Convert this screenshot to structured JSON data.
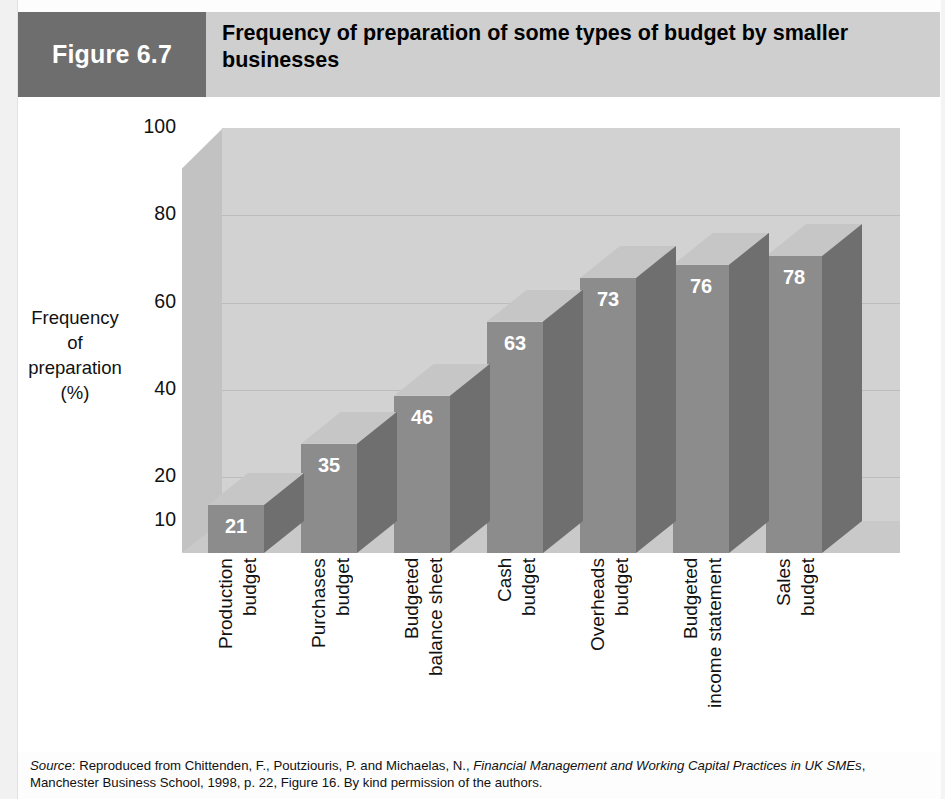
{
  "header": {
    "figure_tag": "Figure 6.7",
    "title": "Frequency of preparation of some types of budget by smaller businesses",
    "tag_bg_color": "#6e6e6e",
    "band_bg_color": "#cfcfcf"
  },
  "chart_data": {
    "type": "bar",
    "title": "Frequency of preparation of some types of budget by smaller businesses",
    "xlabel": "",
    "ylabel": "Frequency of preparation (%)",
    "ylim": [
      10,
      100
    ],
    "yticks": [
      "100",
      "80",
      "60",
      "40",
      "20",
      "10"
    ],
    "grid": true,
    "legend": "none",
    "style": "3d-column",
    "bar_front_color": "#8c8c8c",
    "bar_side_color": "#6f6f6f",
    "bar_top_color": "#c6c6c6",
    "wall_color": "#d2d2d2",
    "floor_color": "#c9c9c9",
    "categories": [
      "Production budget",
      "Purchases budget",
      "Budgeted balance sheet",
      "Cash budget",
      "Overheads budget",
      "Budgeted income statement",
      "Sales budget"
    ],
    "category_lines": [
      [
        "Production",
        "budget"
      ],
      [
        "Purchases",
        "budget"
      ],
      [
        "Budgeted",
        "balance sheet"
      ],
      [
        "Cash",
        "budget"
      ],
      [
        "Overheads",
        "budget"
      ],
      [
        "Budgeted",
        "income statement"
      ],
      [
        "Sales",
        "budget"
      ]
    ],
    "values": [
      21,
      35,
      46,
      63,
      73,
      76,
      78
    ],
    "value_labels": [
      "21",
      "35",
      "46",
      "63",
      "73",
      "76",
      "78"
    ]
  },
  "y_axis": {
    "title_lines": [
      "Frequency",
      "of",
      "preparation",
      "(%)"
    ]
  },
  "source": {
    "label": "Source",
    "colon": ": ",
    "text_before": "Reproduced from Chittenden, F., Poutziouris, P. and Michaelas, N., ",
    "publication": "Financial Management and Working Capital Practices in UK SMEs",
    "text_after": ", Manchester Business School, 1998, p. 22, Figure 16. By kind permission of the authors."
  }
}
